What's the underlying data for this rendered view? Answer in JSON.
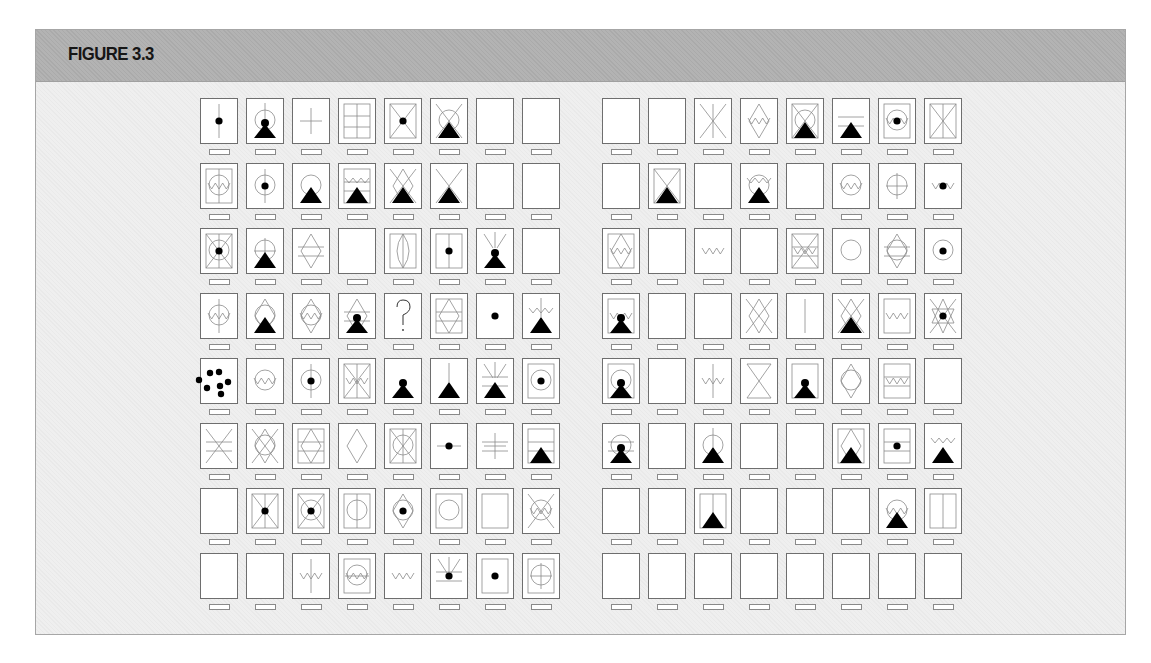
{
  "figure": {
    "title": "FIGURE 3.3",
    "colors": {
      "header": "#b3b3b3",
      "body": "#efefef",
      "card_border": "#6e6e6e",
      "ink": "#000000",
      "thin_line": "#8c8c8c"
    },
    "layout": {
      "rows": 8,
      "cols_per_panel": 8,
      "panels": 2,
      "left_panel_x": 200,
      "right_panel_x": 602,
      "col_step": 46,
      "top_y": 98,
      "row_step": 65
    }
  },
  "panels": [
    {
      "name": "left-panel",
      "rows": [
        [
          [
            "vline",
            "dot"
          ],
          [
            "circle",
            "vtop",
            "pawn"
          ],
          [
            "cross"
          ],
          [
            "frame",
            "grid"
          ],
          [
            "frame",
            "xdiag",
            "dot"
          ],
          [
            "xdiag",
            "circle",
            "tri"
          ],
          [],
          []
        ],
        [
          [
            "frame",
            "circle",
            "zig",
            "vline"
          ],
          [
            "circle",
            "vline",
            "dot"
          ],
          [
            "circle",
            "tri"
          ],
          [
            "frame",
            "zigtop",
            "hline2",
            "tri"
          ],
          [
            "xdiag",
            "diamond",
            "tri"
          ],
          [
            "xdiag",
            "tri"
          ],
          [],
          []
        ],
        [
          [
            "frame",
            "xdiag",
            "circle",
            "vline",
            "dot"
          ],
          [
            "circle",
            "cross",
            "tri"
          ],
          [
            "diamond",
            "hline2"
          ],
          [],
          [
            "frame",
            "lens",
            "vline"
          ],
          [
            "frame",
            "vline",
            "dot"
          ],
          [
            "rays",
            "pawn"
          ],
          []
        ],
        [
          [
            "circle",
            "zig",
            "vline"
          ],
          [
            "diamond",
            "circle",
            "tri"
          ],
          [
            "diamond",
            "circle",
            "zig"
          ],
          [
            "diamond",
            "hline2",
            "pawn"
          ],
          [
            "question"
          ],
          [
            "frame",
            "diamond",
            "hline2"
          ],
          [
            "dot"
          ],
          [
            "vtop",
            "zigtop",
            "tri"
          ]
        ],
        [
          [
            "dots"
          ],
          [
            "circle",
            "zig"
          ],
          [
            "circle",
            "vline",
            "dot"
          ],
          [
            "frame",
            "xdiag",
            "zig",
            "vline"
          ],
          [
            "pawn"
          ],
          [
            "vtop",
            "tri"
          ],
          [
            "rays",
            "hline2",
            "tri"
          ],
          [
            "frame",
            "circle",
            "dot"
          ]
        ],
        [
          [
            "xdiag",
            "hline2"
          ],
          [
            "xdiag",
            "circle",
            "diamond"
          ],
          [
            "frame",
            "diamond",
            "hline2"
          ],
          [
            "diamond"
          ],
          [
            "frame",
            "xdiag",
            "circle",
            "vline"
          ],
          [
            "hline",
            "dot"
          ],
          [
            "cross",
            "hline2"
          ],
          [
            "frame",
            "hline2",
            "tri"
          ]
        ],
        [
          [],
          [
            "frame",
            "xdiag",
            "vline",
            "dot"
          ],
          [
            "frame",
            "xdiag",
            "circle",
            "dot"
          ],
          [
            "frame",
            "circle",
            "vline"
          ],
          [
            "diamond",
            "circle",
            "dot"
          ],
          [
            "frame",
            "circle"
          ],
          [
            "frame"
          ],
          [
            "xdiag",
            "circle",
            "zig"
          ]
        ],
        [
          [],
          [],
          [
            "zig",
            "vline"
          ],
          [
            "frame",
            "circle",
            "zig",
            "hline"
          ],
          [
            "zig"
          ],
          [
            "rays",
            "hline2",
            "dot"
          ],
          [
            "frame",
            "dot"
          ],
          [
            "frame",
            "circle",
            "cross"
          ]
        ]
      ]
    },
    {
      "name": "right-panel",
      "rows": [
        [
          [],
          [],
          [
            "xdiag",
            "vline"
          ],
          [
            "diamond",
            "zig"
          ],
          [
            "frame",
            "xdiag",
            "circle",
            "tri"
          ],
          [
            "hline2",
            "tri"
          ],
          [
            "frame",
            "circle",
            "zig",
            "dot"
          ],
          [
            "frame",
            "xdiag",
            "vline"
          ]
        ],
        [
          [],
          [
            "frame",
            "xdiag",
            "tri"
          ],
          [],
          [
            "circle",
            "zigtop",
            "tri"
          ],
          [],
          [
            "circle",
            "zig"
          ],
          [
            "circle",
            "cross"
          ],
          [
            "zig",
            "dot"
          ]
        ],
        [
          [
            "frame",
            "diamond",
            "zig"
          ],
          [],
          [
            "zig"
          ],
          [],
          [
            "frame",
            "xdiag",
            "zig",
            "hline2"
          ],
          [
            "circle"
          ],
          [
            "diamond",
            "circle",
            "hline2"
          ],
          [
            "circle",
            "dot"
          ]
        ],
        [
          [
            "frame",
            "zig",
            "pawn"
          ],
          [],
          [],
          [
            "xdiag",
            "diamond"
          ],
          [
            "vline"
          ],
          [
            "xdiag",
            "diamond",
            "tri"
          ],
          [
            "frame",
            "zig"
          ],
          [
            "xdiag",
            "star",
            "dot"
          ]
        ],
        [
          [
            "frame",
            "circle",
            "pawn"
          ],
          [],
          [
            "zig",
            "vline"
          ],
          [
            "hourglass"
          ],
          [
            "frame",
            "pawn"
          ],
          [
            "diamond",
            "circle"
          ],
          [
            "frame",
            "zig",
            "hline2"
          ],
          []
        ],
        [
          [
            "circle",
            "hline2",
            "pawn"
          ],
          [],
          [
            "circle",
            "vtop",
            "tri"
          ],
          [],
          [],
          [
            "frame",
            "diamond",
            "tri"
          ],
          [
            "frame",
            "hline2",
            "dot"
          ],
          [
            "zigtop",
            "tri"
          ]
        ],
        [
          [],
          [],
          [
            "frame",
            "vline",
            "tri"
          ],
          [],
          [],
          [],
          [
            "circle",
            "zig",
            "tri"
          ],
          [
            "frame",
            "vline"
          ]
        ],
        [
          [],
          [],
          [],
          [],
          [],
          [],
          [],
          []
        ]
      ]
    }
  ]
}
